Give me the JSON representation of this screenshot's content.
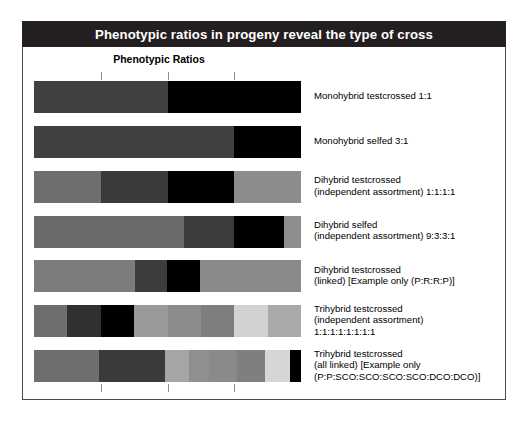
{
  "figure": {
    "title": "Phenotypic ratios in progeny reveal the type of cross",
    "axis_title": "Phenotypic Ratios"
  },
  "chart_data": {
    "type": "bar",
    "orientation": "horizontal",
    "title": "Phenotypic ratios in progeny reveal the type of cross",
    "xlabel": "Phenotypic Ratios",
    "ylabel": "",
    "xlim": [
      0,
      1
    ],
    "grid": false,
    "legend_position": "right",
    "xticks": [
      0.25,
      0.5,
      0.75
    ],
    "xtick_labels": [
      "",
      "",
      ""
    ],
    "stacked": true,
    "normalized": true,
    "rows": [
      {
        "label_lines": [
          "Monohybrid testcrossed 1:1"
        ],
        "ratio": [
          1,
          1
        ],
        "fractions": [
          0.5,
          0.5
        ],
        "colors": [
          "#414141",
          "#000000"
        ]
      },
      {
        "label_lines": [
          "Monohybrid selfed 3:1"
        ],
        "ratio": [
          3,
          1
        ],
        "fractions": [
          0.75,
          0.25
        ],
        "colors": [
          "#414141",
          "#000000"
        ]
      },
      {
        "label_lines": [
          "Dihybrid testcrossed",
          "(independent assortment) 1:1:1:1"
        ],
        "ratio": [
          1,
          1,
          1,
          1
        ],
        "fractions": [
          0.25,
          0.25,
          0.25,
          0.25
        ],
        "colors": [
          "#6e6e6e",
          "#3a3a3a",
          "#000000",
          "#8c8c8c"
        ]
      },
      {
        "label_lines": [
          "Dihybrid selfed",
          "(independent assortment) 9:3:3:1"
        ],
        "ratio": [
          9,
          3,
          3,
          1
        ],
        "fractions": [
          0.5625,
          0.1875,
          0.1875,
          0.0625
        ],
        "colors": [
          "#6a6a6a",
          "#3c3c3c",
          "#000000",
          "#8e8e8e"
        ]
      },
      {
        "label_lines": [
          "Dihybrid testcrossed",
          "(linked) [Example only (P:R:R:P)]"
        ],
        "ratio": [
          3,
          1,
          1,
          3
        ],
        "fractions": [
          0.38,
          0.12,
          0.12,
          0.38
        ],
        "colors": [
          "#7c7c7c",
          "#3c3c3c",
          "#000000",
          "#8a8a8a"
        ]
      },
      {
        "label_lines": [
          "Trihybrid testcrossed",
          "(independent assortment)",
          "1:1:1:1:1:1:1:1"
        ],
        "ratio": [
          1,
          1,
          1,
          1,
          1,
          1,
          1,
          1
        ],
        "fractions": [
          0.125,
          0.125,
          0.125,
          0.125,
          0.125,
          0.125,
          0.125,
          0.125
        ],
        "colors": [
          "#6e6e6e",
          "#303030",
          "#000000",
          "#9a9a9a",
          "#8b8b8b",
          "#7e7e7e",
          "#d2d2d2",
          "#a9a9a9"
        ]
      },
      {
        "label_lines": [
          "Trihybrid testcrossed",
          "(all linked) [Example only",
          "(P:P:SCO:SCO:SCO:SCO:DCO:DCO)]"
        ],
        "ratio": [
          7,
          7,
          3,
          3,
          3,
          3,
          1,
          1
        ],
        "fractions": [
          0.245,
          0.245,
          0.09,
          0.075,
          0.105,
          0.105,
          0.095,
          0.04
        ],
        "colors": [
          "#6e6e6e",
          "#3a3a3a",
          "#a5a5a5",
          "#8f8f8f",
          "#8a8a8a",
          "#7f7f7f",
          "#d6d6d6",
          "#000000"
        ]
      }
    ]
  },
  "colors": {
    "title_bar_bg": "#231f20",
    "title_bar_text": "#ffffff",
    "panel_border": "#4b4b4b",
    "tick": "#8d8d8d",
    "background": "#ffffff"
  }
}
